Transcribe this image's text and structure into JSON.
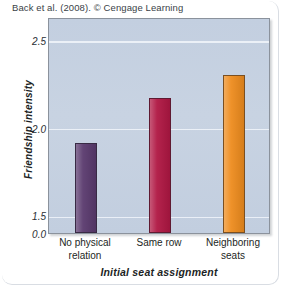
{
  "caption": "Back et al. (2008). © Cengage Learning",
  "chart_data": {
    "type": "bar",
    "title": "",
    "xlabel": "Initial seat assignment",
    "ylabel": "Friendship intensity",
    "categories": [
      "No physical\nrelation",
      "Same row",
      "Neighboring\nseats"
    ],
    "values": [
      1.91,
      2.17,
      2.3
    ],
    "bar_colors": [
      "#5a3a6e",
      "#b01743",
      "#ee8c1e"
    ],
    "ytick_labels": [
      "0.0",
      "1.5",
      "2.0",
      "2.5"
    ],
    "ytick_values": [
      0.0,
      1.5,
      2.0,
      2.5
    ],
    "ylim": [
      1.4,
      2.63
    ],
    "axis_break": true,
    "grid": true,
    "grid_color": "#eef2f8",
    "plot_background": "#c5d0e0",
    "legend": "none"
  }
}
